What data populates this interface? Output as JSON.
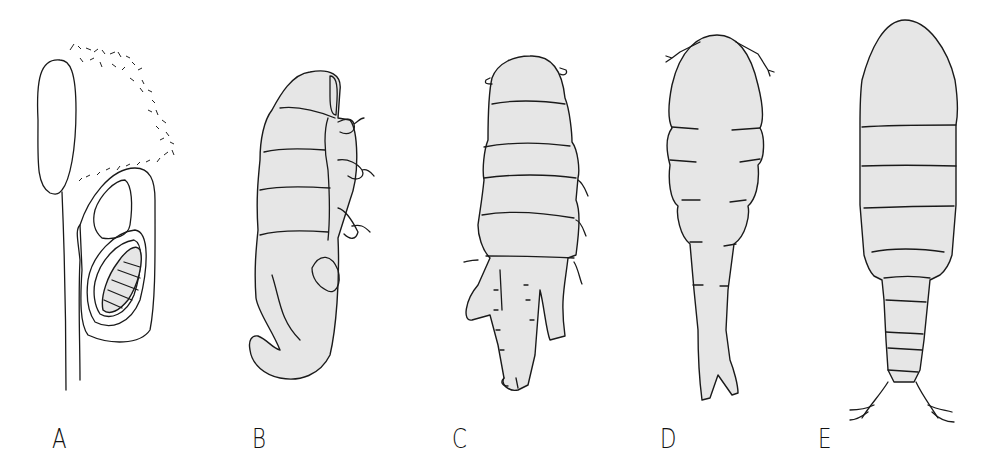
{
  "figure": {
    "panels": [
      {
        "id": "A",
        "label": "A",
        "description": "host tissue with embedded parasite capsule containing segmented larva"
      },
      {
        "id": "B",
        "label": "B",
        "description": "curved segmented larva, lateral view with appendages"
      },
      {
        "id": "C",
        "label": "C",
        "description": "segmented larva, dorsal view with caudal lobes"
      },
      {
        "id": "D",
        "label": "D",
        "description": "elongate stage with antennae and forked tail"
      },
      {
        "id": "E",
        "label": "E",
        "description": "adult copepod-like form with caudal rami setae"
      }
    ],
    "colors": {
      "fill": "#e6e6e6",
      "stroke": "#1a1a1a",
      "background": "#ffffff"
    }
  }
}
